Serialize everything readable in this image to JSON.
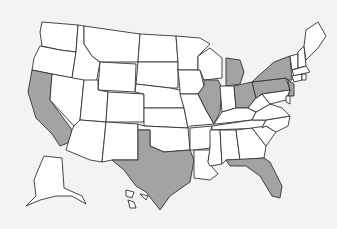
{
  "map": {
    "title": "United States",
    "colors": {
      "highlighted": "#a3a3a3",
      "default": "#ffffff",
      "background": "#f3f3f3",
      "border": "#333333"
    },
    "highlighted_states": [
      "CA",
      "TX",
      "IL",
      "MI",
      "OH",
      "PA",
      "NY",
      "NJ",
      "FL"
    ],
    "states": [
      {
        "id": "WA",
        "points": "42,22 78,25 76,52 60,50 42,46 40,32"
      },
      {
        "id": "OR",
        "points": "40,46 60,50 76,52 72,78 32,70 34,58"
      },
      {
        "id": "CA",
        "points": "32,70 52,74 50,100 72,130 70,142 60,146 52,134 36,118 28,92"
      },
      {
        "id": "ID",
        "points": "78,25 84,26 84,44 92,56 100,62 96,84 72,78 76,52"
      },
      {
        "id": "NV",
        "points": "52,74 84,80 80,120 74,126 50,100"
      },
      {
        "id": "MT",
        "points": "84,26 140,34 138,62 100,62 92,56 84,44"
      },
      {
        "id": "WY",
        "points": "100,62 136,64 135,92 98,90"
      },
      {
        "id": "UT",
        "points": "84,80 98,80 98,90 108,92 106,122 80,120"
      },
      {
        "id": "AZ",
        "points": "80,120 106,122 102,162 90,160 66,150 72,130 74,126"
      },
      {
        "id": "CO",
        "points": "108,92 144,94 144,122 106,122"
      },
      {
        "id": "NM",
        "points": "106,122 138,124 138,160 112,160 102,162"
      },
      {
        "id": "ND",
        "points": "140,34 176,36 178,62 138,62"
      },
      {
        "id": "SD",
        "points": "138,62 178,62 178,88 170,88 136,84"
      },
      {
        "id": "NE",
        "points": "136,84 170,88 180,90 184,108 144,108 144,94 135,92"
      },
      {
        "id": "KS",
        "points": "144,108 184,108 188,128 144,126"
      },
      {
        "id": "OK",
        "points": "138,124 144,126 188,128 190,150 164,152 150,146 150,130 138,130"
      },
      {
        "id": "TX",
        "points": "138,130 150,130 150,146 164,152 190,150 194,160 190,182 170,196 160,210 146,192 136,186 124,170 112,160 138,160"
      },
      {
        "id": "MN",
        "points": "176,36 200,38 210,44 198,56 198,70 178,70 178,62"
      },
      {
        "id": "IA",
        "points": "178,70 200,70 204,86 198,94 180,94 180,90"
      },
      {
        "id": "MO",
        "points": "180,94 198,94 206,110 214,124 190,126 188,128 184,108"
      },
      {
        "id": "AR",
        "points": "190,128 212,126 210,148 194,150 190,150"
      },
      {
        "id": "LA",
        "points": "194,150 210,150 208,162 218,174 210,180 194,178 194,160"
      },
      {
        "id": "WI",
        "points": "198,56 210,48 222,58 222,78 204,80 200,70 198,70"
      },
      {
        "id": "IL",
        "points": "204,80 218,80 222,88 220,112 214,124 206,110 198,94 204,86"
      },
      {
        "id": "MI",
        "points": "226,58 240,60 244,72 240,84 226,86 226,72"
      },
      {
        "id": "IN",
        "points": "220,86 234,86 236,108 222,112"
      },
      {
        "id": "OH",
        "points": "234,86 252,82 256,98 248,108 236,108"
      },
      {
        "id": "KY",
        "points": "214,124 222,112 236,108 248,108 256,112 252,120 216,124"
      },
      {
        "id": "TN",
        "points": "212,126 252,120 266,120 262,128 212,130"
      },
      {
        "id": "MS",
        "points": "210,130 220,130 222,164 210,166 208,162 210,148"
      },
      {
        "id": "AL",
        "points": "220,130 236,130 240,160 226,160 222,164"
      },
      {
        "id": "GA",
        "points": "236,130 252,128 266,146 264,158 240,160"
      },
      {
        "id": "FL",
        "points": "226,160 264,158 270,162 282,186 280,198 272,196 260,176 246,166 230,166"
      },
      {
        "id": "SC",
        "points": "252,128 266,126 276,132 266,146"
      },
      {
        "id": "NC",
        "points": "262,128 266,120 290,116 288,126 276,132 266,126"
      },
      {
        "id": "VA",
        "points": "252,120 256,112 270,104 282,108 290,116 266,120"
      },
      {
        "id": "WV",
        "points": "256,98 262,94 270,104 256,112 248,108"
      },
      {
        "id": "PA",
        "points": "252,82 286,78 290,90 262,94 256,98"
      },
      {
        "id": "NY",
        "points": "256,78 274,62 290,56 292,80 288,80 286,78 252,82"
      },
      {
        "id": "NJ",
        "points": "288,80 294,84 294,96 288,96 290,90"
      },
      {
        "id": "MD",
        "points": "262,94 290,90 286,100 270,104"
      },
      {
        "id": "DE",
        "points": "286,96 290,96 290,104 286,102"
      },
      {
        "id": "VT",
        "points": "290,56 298,54 298,68 292,70"
      },
      {
        "id": "NH",
        "points": "298,52 304,46 306,66 298,68"
      },
      {
        "id": "ME",
        "points": "304,46 306,30 318,22 326,36 318,48 306,60"
      },
      {
        "id": "MA",
        "points": "292,70 306,66 310,72 294,76"
      },
      {
        "id": "CT",
        "points": "292,76 302,74 302,80 294,82"
      },
      {
        "id": "RI",
        "points": "302,74 306,74 306,80 302,80"
      },
      {
        "id": "AK",
        "points": "44,156 62,158 64,188 82,196 86,204 72,196 56,196 40,200 26,206 36,196 34,180 38,170"
      },
      {
        "id": "HI",
        "points": "126,190 134,192 132,198 126,196"
      },
      {
        "id": "HI2",
        "points": "140,194 148,196 146,200"
      },
      {
        "id": "HI3",
        "points": "128,200 134,202 136,208 130,208"
      }
    ]
  }
}
